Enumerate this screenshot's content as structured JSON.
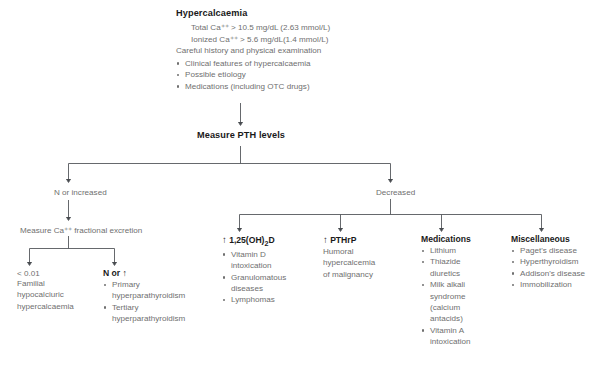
{
  "diagram": {
    "type": "clinical-flowchart",
    "title": "Hypercalcaemia",
    "header": {
      "title": "Hypercalcaemia",
      "criteria": [
        "Total Ca⁺⁺ > 10.5 mg/dL (2.63 mmol/L)",
        "Ionized Ca⁺⁺ > 5.6 mg/dL(1.4 mmol/L)"
      ],
      "assessment_line": "Careful history and physical examination",
      "assessment_items": [
        "Clinical features of hypercalcaemia",
        "Possible etiology",
        "Medications (including OTC drugs)"
      ]
    },
    "step_measure_pth": "Measure PTH levels",
    "branch_labels": {
      "left": "N or increased",
      "right": "Decreased"
    },
    "left_branch": {
      "step": "Measure Ca⁺⁺ fractional excretion",
      "outcomes": [
        {
          "label": "< 0.01",
          "lines": [
            "Familial",
            "hypocalciuric",
            "hypercalcaemia"
          ],
          "bullets": []
        },
        {
          "label": "N or ↑",
          "lines": [],
          "bullets": [
            "Primary hyperparathyroidism",
            "Tertiary hyperparathyroidism"
          ]
        }
      ]
    },
    "right_branch": {
      "columns": [
        {
          "heading": "↑ 1,25(OH)₂D",
          "heading_prefix": "↑",
          "heading_main": "1,25(OH)",
          "heading_sub": "2",
          "heading_tail": "D",
          "bullets": [
            "Vitamin D intoxication",
            "Granulomatous diseases",
            "Lymphomas"
          ]
        },
        {
          "heading": "↑ PTHrP",
          "heading_prefix": "↑",
          "heading_main": "PTHrP",
          "bullets": [],
          "lines": [
            "Humoral",
            "hypercalcemia",
            "of malignancy"
          ]
        },
        {
          "heading": "Medications",
          "bullets": [
            "Lithium",
            "Thiazide diuretics",
            "Milk alkali syndrome (calcium antacids)",
            "Vitamin A intoxication"
          ]
        },
        {
          "heading": "Miscellaneous",
          "bullets": [
            "Paget's disease",
            "Hyperthyroidism",
            "Addison's disease",
            "Immobilization"
          ]
        }
      ]
    },
    "colors": {
      "line": "#55585c",
      "text": "#6f6f6f",
      "heading_text": "#1a1a1a",
      "background": "#ffffff"
    }
  }
}
